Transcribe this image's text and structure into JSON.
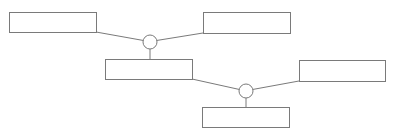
{
  "diagram": {
    "type": "tree-connector-diagram",
    "stroke_color": "#7a7a7a",
    "background": "#ffffff",
    "boxes": [
      {
        "id": "box-1",
        "label": "",
        "x": 9,
        "y": 12,
        "w": 87,
        "h": 20
      },
      {
        "id": "box-2",
        "label": "",
        "x": 203,
        "y": 12,
        "w": 87,
        "h": 21
      },
      {
        "id": "box-3",
        "label": "",
        "x": 105,
        "y": 59,
        "w": 87,
        "h": 20
      },
      {
        "id": "box-4",
        "label": "",
        "x": 299,
        "y": 60,
        "w": 87,
        "h": 21
      },
      {
        "id": "box-5",
        "label": "",
        "x": 202,
        "y": 107,
        "w": 87,
        "h": 20
      }
    ],
    "junctions": [
      {
        "id": "junction-1",
        "cx": 150,
        "cy": 42,
        "r": 7,
        "inputs": [
          "box-1",
          "box-2"
        ],
        "output": "box-3"
      },
      {
        "id": "junction-2",
        "cx": 246,
        "cy": 91,
        "r": 7,
        "inputs": [
          "box-3",
          "box-4"
        ],
        "output": "box-5"
      }
    ]
  }
}
